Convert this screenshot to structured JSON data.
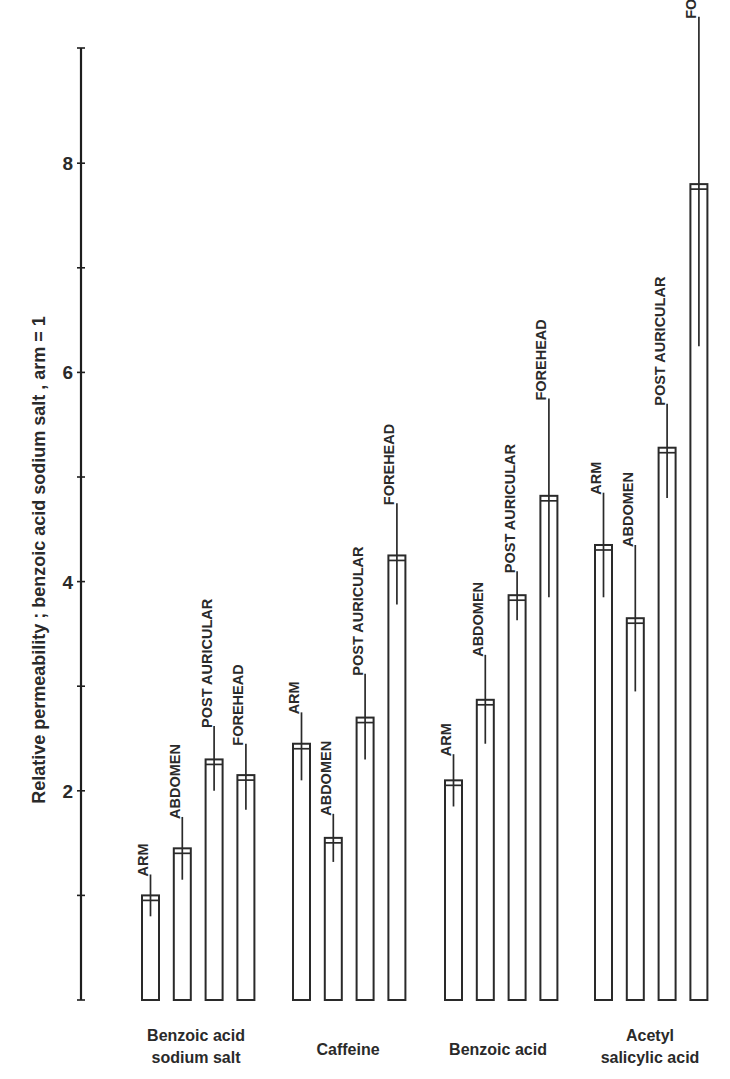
{
  "chart_data": {
    "type": "bar",
    "title": "",
    "xlabel": "",
    "ylabel": "Relative permeability ; benzoic acid sodium salt , arm = 1",
    "ylim": [
      0,
      9
    ],
    "yticks": [
      {
        "value": 1,
        "label": ""
      },
      {
        "value": 2,
        "label": "2"
      },
      {
        "value": 3,
        "label": ""
      },
      {
        "value": 4,
        "label": "4"
      },
      {
        "value": 5,
        "label": ""
      },
      {
        "value": 6,
        "label": "6"
      },
      {
        "value": 7,
        "label": ""
      },
      {
        "value": 8,
        "label": "8"
      }
    ],
    "categories": [
      {
        "label_lines": [
          "Benzoic acid",
          "sodium salt"
        ]
      },
      {
        "label_lines": [
          "Caffeine"
        ]
      },
      {
        "label_lines": [
          "Benzoic acid"
        ]
      },
      {
        "label_lines": [
          "Acetyl",
          "salicylic acid"
        ]
      }
    ],
    "series": [
      {
        "name": "ARM",
        "values": [
          1.0,
          2.45,
          2.1,
          4.35
        ],
        "err_low": [
          0.8,
          2.1,
          1.85,
          3.85
        ],
        "err_high": [
          1.2,
          2.75,
          2.35,
          4.85
        ]
      },
      {
        "name": "ABDOMEN",
        "values": [
          1.45,
          1.55,
          2.87,
          3.65
        ],
        "err_low": [
          1.15,
          1.32,
          2.45,
          2.95
        ],
        "err_high": [
          1.75,
          1.78,
          3.3,
          4.35
        ]
      },
      {
        "name": "POST AURICULAR",
        "values": [
          2.3,
          2.7,
          3.87,
          5.28
        ],
        "err_low": [
          2.0,
          2.3,
          3.63,
          4.8
        ],
        "err_high": [
          2.62,
          3.12,
          4.1,
          5.7
        ]
      },
      {
        "name": "FOREHEAD",
        "values": [
          2.15,
          4.25,
          4.82,
          7.8
        ],
        "err_low": [
          1.82,
          3.78,
          3.85,
          6.25
        ],
        "err_high": [
          2.45,
          4.75,
          5.75,
          9.4
        ]
      }
    ],
    "grid": false,
    "legend": "none"
  }
}
